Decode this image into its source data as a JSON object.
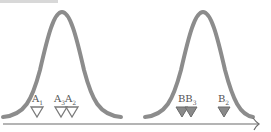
{
  "diagram": {
    "title_fragment": "",
    "axis": {
      "color": "#6b6b6b",
      "arrow": true
    },
    "curves": [
      {
        "name": "distribution-a",
        "center_x": 62,
        "color": "#8c8c8c"
      },
      {
        "name": "distribution-b",
        "center_x": 203,
        "color": "#8c8c8c"
      }
    ],
    "markers": [
      {
        "id": "A1",
        "label": "A",
        "sub": "1",
        "x": 37,
        "fill": "#ffffff",
        "stroke": "#7a7a7a",
        "group": "A"
      },
      {
        "id": "A3",
        "label": "A",
        "sub": "3",
        "x": 61,
        "fill": "#ffffff",
        "stroke": "#7a7a7a",
        "group": "A"
      },
      {
        "id": "A2",
        "label": "A",
        "sub": "2",
        "x": 72,
        "fill": "#ffffff",
        "stroke": "#7a7a7a",
        "group": "A"
      },
      {
        "id": "B",
        "label": "B",
        "sub": "",
        "x": 182,
        "fill": "#8a8a8a",
        "stroke": "#6a6a6a",
        "group": "B"
      },
      {
        "id": "B3",
        "label": "B",
        "sub": "3",
        "x": 191,
        "fill": "#8a8a8a",
        "stroke": "#6a6a6a",
        "group": "B"
      },
      {
        "id": "B2",
        "label": "B",
        "sub": "2",
        "x": 224,
        "fill": "#8a8a8a",
        "stroke": "#6a6a6a",
        "group": "B"
      }
    ],
    "labels": {
      "A1": {
        "text": "A",
        "sub": "1"
      },
      "A3A2": {
        "text1": "A",
        "sub1": "3",
        "text2": "A",
        "sub2": "2"
      },
      "BB3": {
        "text1": "B",
        "text2": "B",
        "sub2": "3"
      },
      "B2": {
        "text": "B",
        "sub": "2"
      }
    }
  }
}
